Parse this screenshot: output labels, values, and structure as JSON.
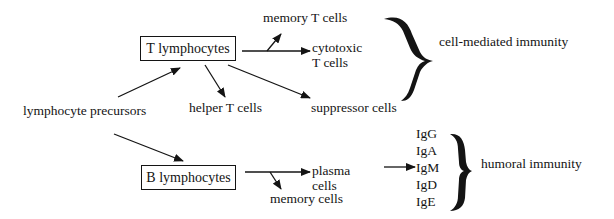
{
  "diagram": {
    "source": {
      "label": "lymphocyte precursors"
    },
    "t_branch": {
      "box_label": "T lymphocytes",
      "outputs": {
        "memory": "memory T cells",
        "cytotoxic_line1": "cytotoxic",
        "cytotoxic_line2": "T cells",
        "helper": "helper T cells",
        "suppressor": "suppressor cells"
      },
      "group_label": "cell-mediated immunity"
    },
    "b_branch": {
      "box_label": "B lymphocytes",
      "outputs": {
        "plasma_line1": "plasma",
        "plasma_line2": "cells",
        "memory": "memory cells"
      },
      "antibodies": [
        "IgG",
        "IgA",
        "IgM",
        "IgD",
        "IgE"
      ],
      "group_label": "humoral immunity"
    },
    "colors": {
      "ink": "#141414",
      "background": "#ffffff"
    }
  }
}
